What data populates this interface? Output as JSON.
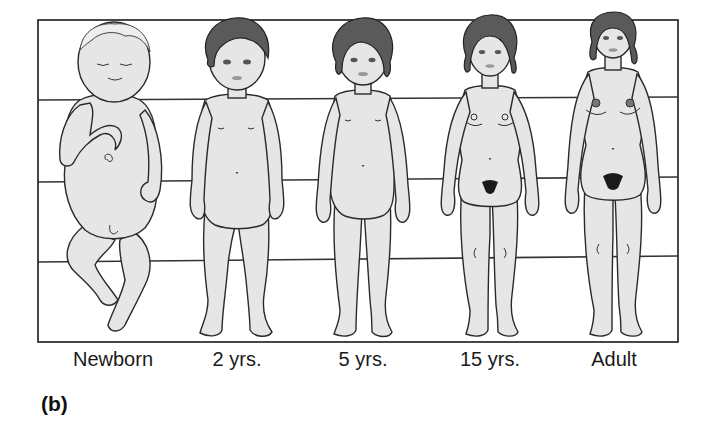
{
  "figure": {
    "panel_label": "(b)",
    "colors": {
      "skin": "#e4e4e4",
      "outline": "#2a2a2a",
      "hair": "#555555",
      "frame": "#333333"
    },
    "grid_lines_y": [
      100,
      182,
      262
    ],
    "stages": [
      {
        "label": "Newborn",
        "center_x": 113
      },
      {
        "label": "2 yrs.",
        "center_x": 237
      },
      {
        "label": "5 yrs.",
        "center_x": 363
      },
      {
        "label": "15 yrs.",
        "center_x": 490
      },
      {
        "label": "Adult",
        "center_x": 614
      }
    ]
  }
}
